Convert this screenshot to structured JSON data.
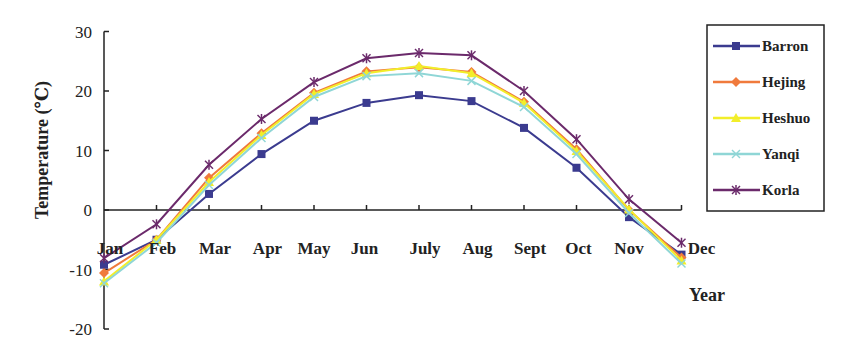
{
  "chart_data": {
    "type": "line",
    "title": "",
    "xlabel": "Year",
    "ylabel": "Temperature (℃)",
    "ylim": [
      -20,
      30
    ],
    "yticks": [
      30,
      20,
      10,
      0,
      -10,
      -20
    ],
    "grid": false,
    "legend_position": "right",
    "categories": [
      "Jan",
      "Feb",
      "Mar",
      "Apr",
      "May",
      "Jun",
      "July",
      "Aug",
      "Sept",
      "Oct",
      "Nov",
      "Dec"
    ],
    "series": [
      {
        "name": "Barron",
        "color": "#3b3b8f",
        "marker": "square",
        "values": [
          -9.2,
          -5.0,
          2.7,
          9.4,
          15.0,
          18.0,
          19.3,
          18.3,
          13.8,
          7.1,
          -1.2,
          -7.5
        ]
      },
      {
        "name": "Hejing",
        "color": "#f07a3c",
        "marker": "diamond",
        "values": [
          -10.6,
          -5.0,
          5.4,
          12.9,
          19.7,
          23.3,
          24.0,
          23.2,
          18.2,
          10.2,
          0.0,
          -8.0
        ]
      },
      {
        "name": "Heshuo",
        "color": "#f2ee2a",
        "marker": "triangle",
        "values": [
          -12.0,
          -5.0,
          4.7,
          12.6,
          19.5,
          23.0,
          24.2,
          23.0,
          18.0,
          9.9,
          0.1,
          -8.5
        ]
      },
      {
        "name": "Yanqi",
        "color": "#8fd6d6",
        "marker": "x",
        "values": [
          -12.3,
          -5.5,
          4.2,
          12.1,
          19.0,
          22.5,
          23.0,
          21.7,
          17.3,
          9.4,
          -0.5,
          -9.0
        ]
      },
      {
        "name": "Korla",
        "color": "#6b2a6b",
        "marker": "star",
        "values": [
          -8.1,
          -2.4,
          7.6,
          15.3,
          21.5,
          25.5,
          26.4,
          26.0,
          20.0,
          11.9,
          1.8,
          -5.5
        ]
      }
    ]
  },
  "chart": {
    "ylabel": "Temperature (℃)",
    "xlabel": "Year"
  }
}
